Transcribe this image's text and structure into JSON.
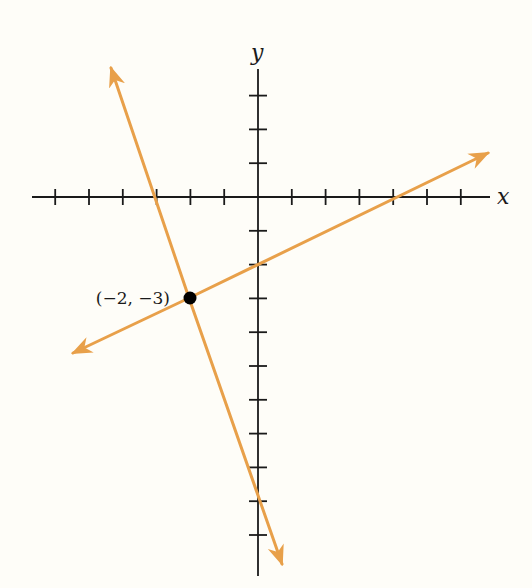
{
  "figure": {
    "x_axis_label": "x",
    "y_axis_label": "y",
    "point_label": "(−2, −3)",
    "colors": {
      "background": "#fefdf8",
      "axis": "#1a1a1a",
      "line": "#e8a04a",
      "point": "#000000"
    }
  },
  "chart_data": {
    "type": "line",
    "title": "",
    "xlabel": "x",
    "ylabel": "y",
    "x_ticks": [
      -6,
      -5,
      -4,
      -3,
      -2,
      -1,
      1,
      2,
      3,
      4,
      5,
      6
    ],
    "y_ticks": [
      3,
      2,
      1,
      -1,
      -2,
      -3,
      -4,
      -5,
      -6,
      -7,
      -8,
      -9,
      -10
    ],
    "tick_labels_shown": false,
    "xlim": [
      -6.6,
      6.8
    ],
    "ylim": [
      -11.2,
      3.8
    ],
    "grid": false,
    "series": [
      {
        "name": "line-1",
        "equation": "y = -3x - 9",
        "slope": -3,
        "y_intercept": -9,
        "x_intercept": -3,
        "arrows": "both",
        "endpoints": [
          [
            -4.4,
            3.8
          ],
          [
            0.7,
            -11.0
          ]
        ]
      },
      {
        "name": "line-2",
        "equation": "y = x/2 - 2",
        "slope": 0.5,
        "y_intercept": -2,
        "x_intercept": 4,
        "arrows": "both",
        "endpoints": [
          [
            -5.5,
            -4.7
          ],
          [
            6.7,
            1.3
          ]
        ]
      }
    ],
    "points": [
      {
        "x": -2,
        "y": -3,
        "label": "(−2, −3)",
        "note": "intersection of the two lines"
      }
    ]
  }
}
